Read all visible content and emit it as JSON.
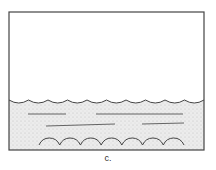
{
  "figure": {
    "caption": "c.",
    "container": {
      "x": 9,
      "y": 12,
      "width": 195,
      "height": 138,
      "stroke": "#444444"
    },
    "water": {
      "surface_y": 100,
      "fill": "#e4e4e4",
      "surface_waves": 10,
      "bottom_waves": {
        "x_start": 39,
        "x_end": 184,
        "y": 145,
        "count": 7
      },
      "current_lines": [
        {
          "x1": 28,
          "y1": 114,
          "x2": 66,
          "y2": 114
        },
        {
          "x1": 96,
          "y1": 114,
          "x2": 183,
          "y2": 114
        },
        {
          "x1": 46,
          "y1": 126,
          "x2": 115,
          "y2": 124
        },
        {
          "x1": 142,
          "y1": 124,
          "x2": 184,
          "y2": 123
        }
      ]
    }
  }
}
